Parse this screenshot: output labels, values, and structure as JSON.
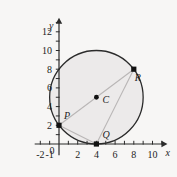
{
  "figure": {
    "background_color": "#f7f6f5",
    "axis_color": "#2b2b2b",
    "circle_stroke": "#2b2b2b",
    "circle_fill": "#eceaea",
    "chord_color": "#b9b6b6",
    "point_color": "#121212"
  },
  "axes": {
    "x_axis_name": "x",
    "y_axis_name": "y",
    "x_ticks": [
      {
        "value": -2,
        "label": "-2"
      },
      {
        "value": -1,
        "label": "-1"
      },
      {
        "value": 0,
        "label": "0"
      },
      {
        "value": 1,
        "label": ""
      },
      {
        "value": 2,
        "label": "2"
      },
      {
        "value": 3,
        "label": ""
      },
      {
        "value": 4,
        "label": "4"
      },
      {
        "value": 5,
        "label": ""
      },
      {
        "value": 6,
        "label": "6"
      },
      {
        "value": 7,
        "label": ""
      },
      {
        "value": 8,
        "label": "8"
      },
      {
        "value": 9,
        "label": ""
      },
      {
        "value": 10,
        "label": "10"
      },
      {
        "value": 11,
        "label": ""
      }
    ],
    "y_ticks": [
      {
        "value": 1,
        "label": ""
      },
      {
        "value": 2,
        "label": "2"
      },
      {
        "value": 3,
        "label": ""
      },
      {
        "value": 4,
        "label": "4"
      },
      {
        "value": 5,
        "label": ""
      },
      {
        "value": 6,
        "label": "6"
      },
      {
        "value": 7,
        "label": ""
      },
      {
        "value": 8,
        "label": "8"
      },
      {
        "value": 9,
        "label": ""
      },
      {
        "value": 10,
        "label": "10"
      },
      {
        "value": 11,
        "label": ""
      },
      {
        "value": 12,
        "label": "12"
      },
      {
        "value": 13,
        "label": ""
      }
    ],
    "x_range": [
      -2.6,
      11.6
    ],
    "y_range": [
      -1.2,
      13.6
    ]
  },
  "circle": {
    "center_label": "C",
    "center_x": 4,
    "center_y": 5,
    "radius": 5
  },
  "points": [
    {
      "name": "P",
      "label": "P",
      "x": 0,
      "y": 2,
      "label_dx": 5,
      "label_dy": -6
    },
    {
      "name": "Q",
      "label": "Q",
      "x": 4,
      "y": 0,
      "label_dx": 6,
      "label_dy": -6
    },
    {
      "name": "R",
      "label": "R",
      "x": 8,
      "y": 8,
      "label_dx": 1,
      "label_dy": 12
    },
    {
      "name": "C",
      "label": "C",
      "x": 4,
      "y": 5,
      "label_dx": 6,
      "label_dy": 6
    }
  ],
  "chords": [
    {
      "name": "chord-p-r",
      "from": "P",
      "to": "R"
    },
    {
      "name": "chord-p-q",
      "from": "P",
      "to": "Q"
    },
    {
      "name": "chord-q-r",
      "from": "Q",
      "to": "R"
    }
  ]
}
